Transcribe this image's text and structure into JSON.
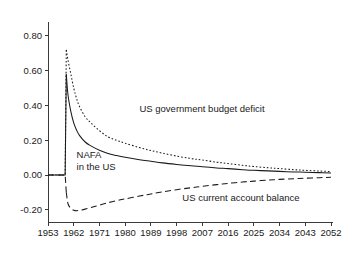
{
  "chart_data": {
    "type": "line",
    "title": "",
    "subtitle": "",
    "xlabel": "",
    "ylabel": "",
    "xlim": [
      1953,
      2052
    ],
    "ylim": [
      -0.27,
      0.88
    ],
    "grid": false,
    "legend_position": "inline-annotations",
    "x_ticks": [
      1953,
      1962,
      1971,
      1980,
      1989,
      1998,
      2007,
      2016,
      2025,
      2034,
      2043,
      2052
    ],
    "x_tick_labels": [
      "1953",
      "1962",
      "1971",
      "1980",
      "1989",
      "1998",
      "2007",
      "2016",
      "2025",
      "2034",
      "2043",
      "2052"
    ],
    "y_ticks": [
      -0.2,
      0.0,
      0.2,
      0.4,
      0.6,
      0.8
    ],
    "y_tick_labels": [
      "-0.20",
      "0.00",
      "0.20",
      "0.40",
      "0.60",
      "0.80"
    ],
    "annotations": [
      {
        "id": "budget-deficit",
        "text": "US government budget deficit",
        "x": 1985,
        "y": 0.36
      },
      {
        "id": "nafa",
        "text_line1": "NAFA",
        "text_line2": "in the US",
        "x": 1963,
        "y": 0.1
      },
      {
        "id": "current-account",
        "text": "US current account balance",
        "x": 2000,
        "y": -0.15
      }
    ],
    "series": [
      {
        "name": "US government budget deficit",
        "style": "dotted",
        "color": "#1a1a1a",
        "x": [
          1953,
          1957,
          1958,
          1959,
          1959.4,
          1960,
          1961,
          1962,
          1963,
          1964,
          1966,
          1968,
          1971,
          1974,
          1977,
          1980,
          1985,
          1989,
          1993,
          1998,
          2003,
          2007,
          2012,
          2016,
          2021,
          2025,
          2030,
          2034,
          2039,
          2043,
          2048,
          2052
        ],
        "y": [
          0.0,
          0.0,
          0.0,
          0.0,
          0.72,
          0.66,
          0.58,
          0.5,
          0.44,
          0.395,
          0.335,
          0.3,
          0.255,
          0.22,
          0.2,
          0.183,
          0.158,
          0.141,
          0.126,
          0.109,
          0.095,
          0.086,
          0.074,
          0.066,
          0.056,
          0.049,
          0.042,
          0.037,
          0.031,
          0.027,
          0.023,
          0.02
        ]
      },
      {
        "name": "NAFA in the US",
        "style": "solid",
        "color": "#1a1a1a",
        "x": [
          1953,
          1957,
          1958,
          1959,
          1959.4,
          1960,
          1961,
          1962,
          1963,
          1964,
          1966,
          1968,
          1971,
          1974,
          1977,
          1980,
          1985,
          1989,
          1993,
          1998,
          2003,
          2007,
          2012,
          2016,
          2021,
          2025,
          2030,
          2034,
          2039,
          2043,
          2048,
          2052
        ],
        "y": [
          0.0,
          0.0,
          0.0,
          0.0,
          0.58,
          0.46,
          0.365,
          0.3,
          0.258,
          0.228,
          0.19,
          0.168,
          0.143,
          0.124,
          0.112,
          0.102,
          0.088,
          0.079,
          0.07,
          0.061,
          0.053,
          0.048,
          0.041,
          0.037,
          0.031,
          0.027,
          0.024,
          0.021,
          0.018,
          0.016,
          0.014,
          0.012
        ]
      },
      {
        "name": "US current account balance",
        "style": "dashed",
        "color": "#1a1a1a",
        "x": [
          1953,
          1957,
          1958,
          1959,
          1959.4,
          1960,
          1961,
          1962,
          1963,
          1964,
          1966,
          1968,
          1971,
          1974,
          1977,
          1980,
          1985,
          1989,
          1993,
          1998,
          2003,
          2007,
          2012,
          2016,
          2021,
          2025,
          2030,
          2034,
          2039,
          2043,
          2048,
          2052
        ],
        "y": [
          0.0,
          0.0,
          0.0,
          0.0,
          -0.1,
          -0.165,
          -0.192,
          -0.202,
          -0.205,
          -0.203,
          -0.196,
          -0.187,
          -0.173,
          -0.159,
          -0.147,
          -0.137,
          -0.121,
          -0.109,
          -0.097,
          -0.084,
          -0.073,
          -0.065,
          -0.055,
          -0.048,
          -0.04,
          -0.035,
          -0.029,
          -0.025,
          -0.021,
          -0.018,
          -0.015,
          -0.013
        ]
      }
    ]
  }
}
